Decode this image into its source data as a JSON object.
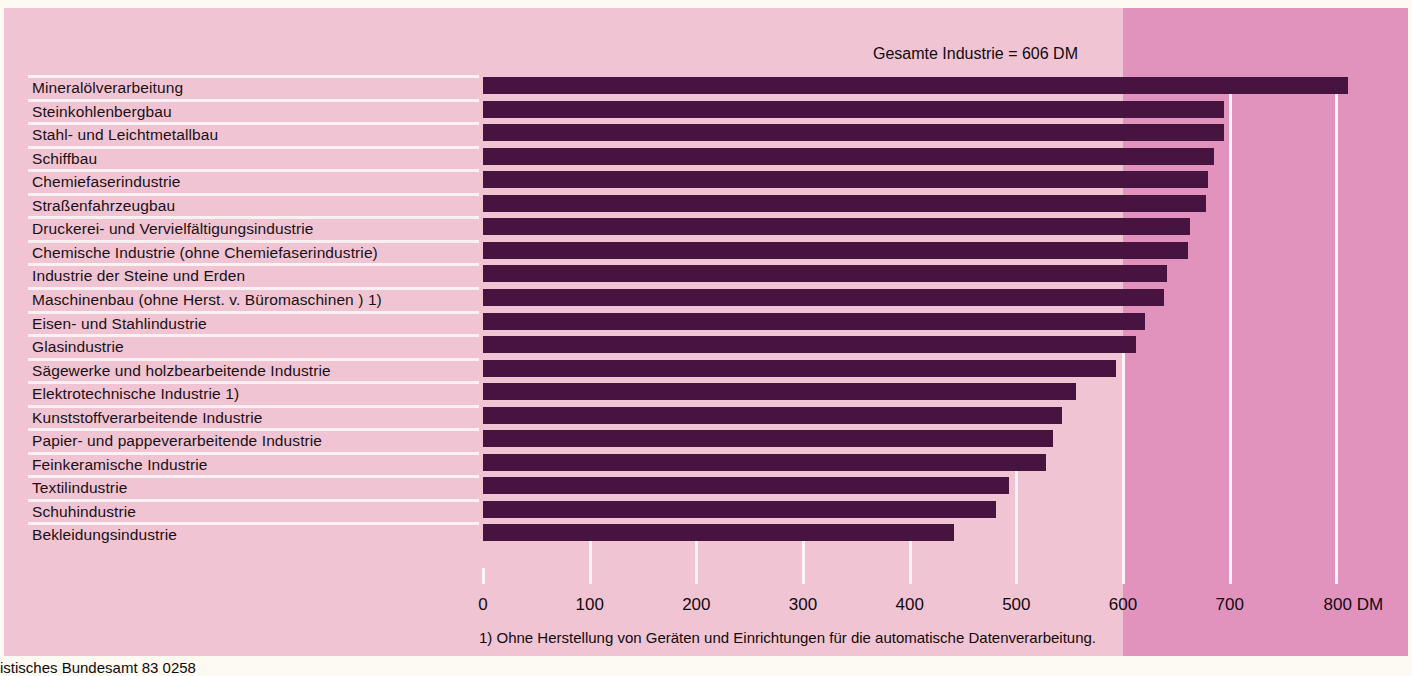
{
  "chart_data": {
    "type": "bar",
    "orientation": "horizontal",
    "title": "",
    "subtitle": "",
    "annotation": "Gesamte Industrie = 606 DM",
    "unit": "DM",
    "xlabel": "DM",
    "ylabel": "",
    "xlim": [
      0,
      830
    ],
    "grid": true,
    "grid_axis": "x",
    "legend": false,
    "reference_value": 606,
    "reference_label": "Gesamte Industrie = 606 DM",
    "highlight_band_from": 600,
    "ticks": [
      {
        "value": 0,
        "label": "0"
      },
      {
        "value": 100,
        "label": "100"
      },
      {
        "value": 200,
        "label": "200"
      },
      {
        "value": 300,
        "label": "300"
      },
      {
        "value": 400,
        "label": "400"
      },
      {
        "value": 500,
        "label": "500"
      },
      {
        "value": 600,
        "label": "600"
      },
      {
        "value": 700,
        "label": "700"
      },
      {
        "value": 800,
        "label": "800 DM"
      }
    ],
    "categories": [
      "Mineralölverarbeitung",
      "Steinkohlenbergbau",
      "Stahl- und Leichtmetallbau",
      "Schiffbau",
      "Chemiefaserindustrie",
      "Straßenfahrzeugbau",
      "Druckerei- und Vervielfältigungsindustrie",
      "Chemische Industrie (ohne Chemiefaserindustrie)",
      "Industrie der Steine und Erden",
      "Maschinenbau (ohne Herst. v. Büromaschinen ) 1)",
      "Eisen- und Stahlindustrie",
      "Glasindustrie",
      "Sägewerke und holzbearbeitende Industrie",
      "Elektrotechnische Industrie 1)",
      "Kunststoffverarbeitende Industrie",
      "Papier- und pappeverarbeitende Industrie",
      "Feinkeramische Industrie",
      "Textilindustrie",
      "Schuhindustrie",
      "Bekleidungsindustrie"
    ],
    "values": [
      811,
      695,
      695,
      685,
      680,
      678,
      663,
      661,
      641,
      638,
      621,
      612,
      593,
      556,
      543,
      534,
      528,
      493,
      481,
      442
    ],
    "bar_color": "#46143f",
    "background_color": "#f0c4d2",
    "highlight_color": "#e193be"
  },
  "footnote": "1) Ohne Herstellung von Geräten und Einrichtungen für die automatische Datenverarbeitung.",
  "source": "istisches Bundesamt 83 0258"
}
